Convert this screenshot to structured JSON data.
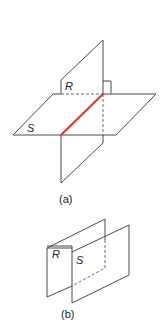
{
  "figure_a": {
    "caption": "(a)",
    "plane_vertical_label": "R",
    "plane_horizontal_label": "S",
    "intersection_color": "#d9342b",
    "right_angle_marker": true
  },
  "figure_b": {
    "caption": "(b)",
    "plane_back_label": "R",
    "plane_front_label": "S"
  }
}
